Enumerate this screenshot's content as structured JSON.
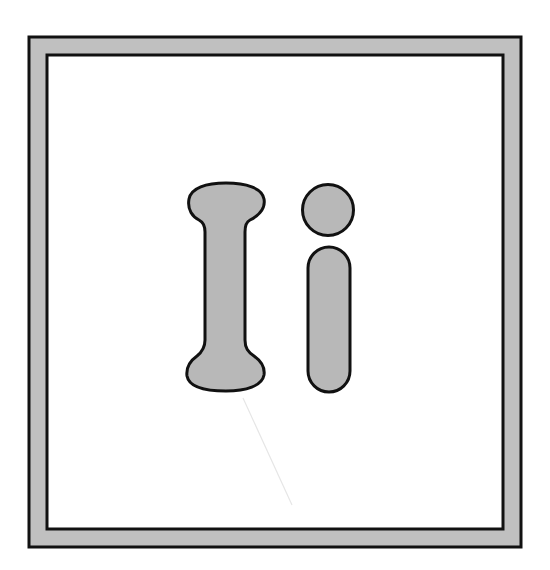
{
  "card": {
    "letters": "Ii",
    "uppercase": "I",
    "lowercase": "i",
    "description": "Alphabet flashcard showing uppercase and lowercase letter I in outline style"
  },
  "colors": {
    "frame_fill": "#c0c0c0",
    "letter_fill": "#b8b8b8",
    "stroke": "#111111",
    "background": "#ffffff"
  }
}
